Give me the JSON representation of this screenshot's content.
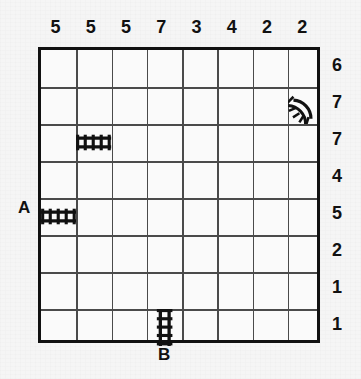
{
  "puzzle": {
    "type": "railroad-track-grid",
    "columns": 8,
    "rows": 8,
    "column_clues": [
      "5",
      "5",
      "5",
      "7",
      "3",
      "4",
      "2",
      "2"
    ],
    "row_clues": [
      "6",
      "7",
      "7",
      "4",
      "5",
      "2",
      "1",
      "1"
    ],
    "endpoints": [
      {
        "label": "A",
        "position": "left-of-row-5"
      },
      {
        "label": "B",
        "position": "below-column-4"
      }
    ],
    "given_pieces": [
      {
        "name": "track-horizontal",
        "row": 3,
        "col": 2,
        "orientation": "horizontal"
      },
      {
        "name": "track-curve",
        "row": 2,
        "col": 8,
        "orientation": "curve-left-down"
      },
      {
        "name": "track-horizontal",
        "row": 5,
        "col": 1,
        "orientation": "horizontal"
      },
      {
        "name": "track-vertical",
        "row": 8,
        "col": 4,
        "orientation": "vertical"
      }
    ],
    "colors": {
      "ink": "#111111",
      "gridline": "#4a4a4a",
      "paper": "#f5f5f5",
      "cell": "#fafafa"
    }
  }
}
